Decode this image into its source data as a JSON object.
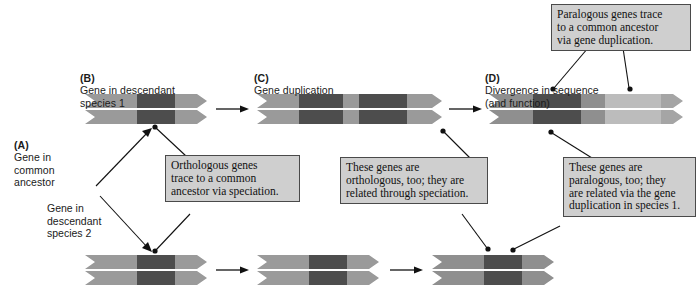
{
  "figure": {
    "background": "#ffffff"
  },
  "colors": {
    "gene_light": "#9a9a9a",
    "gene_mid": "#8a8a8a",
    "gene_dark": "#4d4d4d",
    "gene_pale": "#bcbcbc",
    "gene_pale2": "#aaaaaa",
    "callout_fill": "#cfcfcf",
    "callout_border": "#4a4a4a",
    "line": "#1a1a1a"
  },
  "panels": [
    {
      "tag": "(A)",
      "text": "Gene in\ncommon\nancestor"
    },
    {
      "tag": "(B)",
      "text": "Gene in descendant\nspecies 1"
    },
    {
      "tag": "(C)",
      "text": "Gene duplication"
    },
    {
      "tag": "(D)",
      "text": "Divergence in sequence\n(and function)"
    }
  ],
  "labels": {
    "species2": "Gene in\ndescendant\nspecies 2"
  },
  "callouts": [
    {
      "id": "paralogous-trace",
      "text": "Paralogous genes trace\nto a common ancestor\nvia gene duplication."
    },
    {
      "id": "orthologous-trace",
      "text": "Orthologous genes\ntrace to a common\nancestor via speciation."
    },
    {
      "id": "orthologous-too",
      "text": "These genes are\northologous, too; they are\nrelated through speciation."
    },
    {
      "id": "paralogous-too",
      "text": "These genes are\nparalogous, too; they\nare related via the gene\nduplication in species 1."
    }
  ],
  "gene_bars": [
    {
      "id": "top-b",
      "row": "species-1",
      "stage": "B",
      "segments": [
        "light",
        "dark",
        "light"
      ]
    },
    {
      "id": "top-c",
      "row": "species-1",
      "stage": "C",
      "segments": [
        "light",
        "dark",
        "light",
        "dark",
        "light"
      ]
    },
    {
      "id": "top-d",
      "row": "species-1",
      "stage": "D",
      "segments": [
        "light",
        "dark",
        "light",
        "pale",
        "pale2"
      ]
    },
    {
      "id": "bot-b",
      "row": "species-2",
      "stage": "B",
      "segments": [
        "light",
        "dark",
        "light"
      ]
    },
    {
      "id": "bot-c",
      "row": "species-2",
      "stage": "C",
      "segments": [
        "light",
        "dark",
        "light"
      ]
    },
    {
      "id": "bot-d",
      "row": "species-2",
      "stage": "D",
      "segments": [
        "light",
        "dark",
        "light"
      ]
    }
  ],
  "arrows": [
    {
      "id": "top-arrow-1",
      "row": "species-1"
    },
    {
      "id": "top-arrow-2",
      "row": "species-1"
    },
    {
      "id": "bot-arrow-1",
      "row": "species-2"
    },
    {
      "id": "bot-arrow-2",
      "row": "species-2"
    }
  ]
}
